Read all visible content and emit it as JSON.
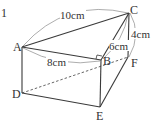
{
  "problem_number": "1",
  "vertices": {
    "A": "A",
    "B": "B",
    "C": "C",
    "D": "D",
    "E": "E",
    "F": "F"
  },
  "measurements": {
    "AC": "10cm",
    "AB": "8cm",
    "BC": "6cm",
    "CF": "4cm"
  },
  "colors": {
    "line": "#3a3a3a",
    "text": "#333333",
    "dimension_arc": "#8a8a8a"
  }
}
